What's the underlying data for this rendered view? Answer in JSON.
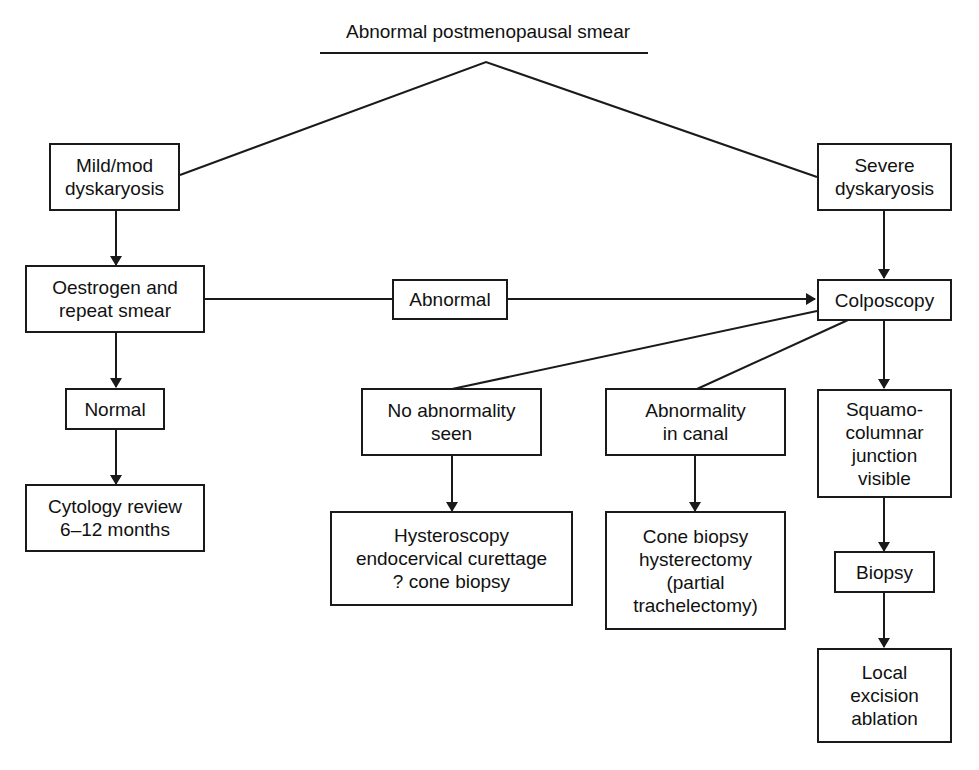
{
  "title": "Abnormal postmenopausal smear",
  "nodes": {
    "mild": "Mild/mod\ndyskaryosis",
    "severe": "Severe\ndyskaryosis",
    "oestrogen": "Oestrogen and\nrepeat smear",
    "abnormal": "Abnormal",
    "colposcopy": "Colposcopy",
    "normal": "Normal",
    "cytology": "Cytology review\n6–12 months",
    "no_abnormality": "No abnormality\nseen",
    "hysteroscopy": "Hysteroscopy\nendocervical curettage\n? cone biopsy",
    "abnormality_canal": "Abnormality\nin canal",
    "cone_biopsy": "Cone biopsy\nhysterectomy\n(partial\ntrachelectomy)",
    "squamo": "Squamo-\ncolumnar\njunction\nvisible",
    "biopsy": "Biopsy",
    "local": "Local\nexcision\nablation"
  },
  "edges": [
    {
      "from": "title",
      "to": "mild"
    },
    {
      "from": "title",
      "to": "severe"
    },
    {
      "from": "mild",
      "to": "oestrogen",
      "arrow": true
    },
    {
      "from": "oestrogen",
      "to": "abnormal"
    },
    {
      "from": "abnormal",
      "to": "colposcopy",
      "arrow": true
    },
    {
      "from": "severe",
      "to": "colposcopy",
      "arrow": true
    },
    {
      "from": "oestrogen",
      "to": "normal",
      "arrow": true
    },
    {
      "from": "normal",
      "to": "cytology",
      "arrow": true
    },
    {
      "from": "colposcopy",
      "to": "no_abnormality"
    },
    {
      "from": "colposcopy",
      "to": "abnormality_canal"
    },
    {
      "from": "colposcopy",
      "to": "squamo",
      "arrow": true
    },
    {
      "from": "no_abnormality",
      "to": "hysteroscopy",
      "arrow": true
    },
    {
      "from": "abnormality_canal",
      "to": "cone_biopsy",
      "arrow": true
    },
    {
      "from": "squamo",
      "to": "biopsy",
      "arrow": true
    },
    {
      "from": "biopsy",
      "to": "local",
      "arrow": true
    }
  ]
}
